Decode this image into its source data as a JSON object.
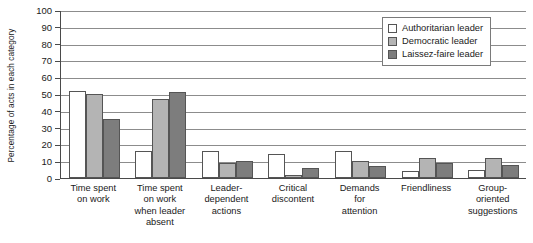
{
  "chart_data": {
    "type": "bar",
    "title": "",
    "xlabel": "",
    "ylabel": "Percentage of acts in each category",
    "ylim": [
      0,
      100
    ],
    "ytick_step": 10,
    "yticks": [
      100,
      90,
      80,
      70,
      60,
      50,
      40,
      30,
      20,
      10,
      0
    ],
    "grid": true,
    "legend_position": "top-right",
    "categories": [
      "Time spent on work",
      "Time spent on work when leader absent",
      "Leader-dependent actions",
      "Critical discontent",
      "Demands for attention",
      "Friendliness",
      "Group-oriented suggestions"
    ],
    "category_lines": [
      [
        "Time spent",
        "on work"
      ],
      [
        "Time spent",
        "on work",
        "when leader",
        "absent"
      ],
      [
        "Leader-",
        "dependent",
        "actions"
      ],
      [
        "Critical",
        "discontent"
      ],
      [
        "Demands",
        "for",
        "attention"
      ],
      [
        "Friendliness"
      ],
      [
        "Group-",
        "oriented",
        "suggestions"
      ]
    ],
    "series": [
      {
        "name": "Authoritarian leader",
        "color": "#ffffff",
        "values": [
          52,
          16,
          16,
          14,
          16,
          4,
          5
        ]
      },
      {
        "name": "Democratic leader",
        "color": "#b4b4b4",
        "values": [
          50,
          47,
          9,
          2,
          10,
          12,
          12
        ]
      },
      {
        "name": "Laissez-faire leader",
        "color": "#7d7d7d",
        "values": [
          35,
          51,
          10,
          6,
          7,
          9,
          8
        ]
      }
    ]
  },
  "legend": {
    "items": [
      {
        "label": "Authoritarian leader"
      },
      {
        "label": "Democratic leader"
      },
      {
        "label": "Laissez-faire leader"
      }
    ]
  }
}
